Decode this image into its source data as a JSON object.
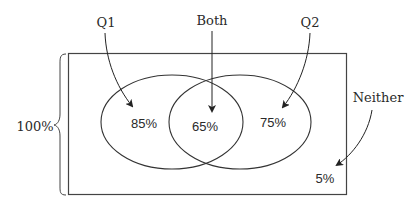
{
  "diagram": {
    "type": "venn",
    "total_label": "100%",
    "sets": [
      {
        "name": "Q1",
        "label": "Q1",
        "value_label": "85%"
      },
      {
        "name": "Q2",
        "label": "Q2",
        "value_label": "75%"
      }
    ],
    "intersection": {
      "label": "Both",
      "value_label": "65%"
    },
    "outside": {
      "label": "Neither",
      "value_label": "5%"
    },
    "colors": {
      "stroke": "#333333",
      "text": "#2a2a2a",
      "background": "#ffffff"
    }
  }
}
